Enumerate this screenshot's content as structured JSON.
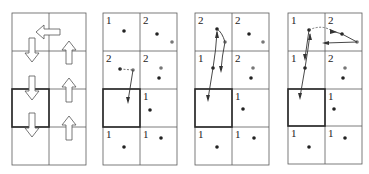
{
  "figure": {
    "panels": [
      {
        "id": "panel-1",
        "kind": "direction-field",
        "cells": [
          {
            "row": 0,
            "col": 0,
            "arrow": "none"
          },
          {
            "row": 0,
            "col": 1,
            "arrow": "left"
          },
          {
            "row": 1,
            "col": 0,
            "arrow": "down"
          },
          {
            "row": 1,
            "col": 1,
            "arrow": "up"
          },
          {
            "row": 2,
            "col": 0,
            "arrow": "down",
            "highlighted": true
          },
          {
            "row": 2,
            "col": 1,
            "arrow": "up"
          },
          {
            "row": 3,
            "col": 0,
            "arrow": "down"
          },
          {
            "row": 3,
            "col": 1,
            "arrow": "up"
          }
        ]
      },
      {
        "id": "panel-2",
        "kind": "occupancy",
        "labels": [
          {
            "row": 0,
            "col": 0,
            "text": "1"
          },
          {
            "row": 0,
            "col": 1,
            "text": "2"
          },
          {
            "row": 1,
            "col": 0,
            "text": "2"
          },
          {
            "row": 1,
            "col": 1,
            "text": "2"
          },
          {
            "row": 2,
            "col": 1,
            "text": "1"
          },
          {
            "row": 3,
            "col": 0,
            "text": "1"
          },
          {
            "row": 3,
            "col": 1,
            "text": "1"
          }
        ],
        "highlighted_cell": {
          "row": 2,
          "col": 0
        }
      },
      {
        "id": "panel-3",
        "kind": "occupancy",
        "labels": [
          {
            "row": 0,
            "col": 0,
            "text": "2"
          },
          {
            "row": 0,
            "col": 1,
            "text": "2"
          },
          {
            "row": 1,
            "col": 0,
            "text": "1"
          },
          {
            "row": 1,
            "col": 1,
            "text": "2"
          },
          {
            "row": 2,
            "col": 1,
            "text": "1"
          },
          {
            "row": 3,
            "col": 0,
            "text": "1"
          },
          {
            "row": 3,
            "col": 1,
            "text": "1"
          }
        ],
        "highlighted_cell": {
          "row": 2,
          "col": 0
        }
      },
      {
        "id": "panel-4",
        "kind": "occupancy",
        "labels": [
          {
            "row": 0,
            "col": 0,
            "text": "1"
          },
          {
            "row": 0,
            "col": 1,
            "text": "2"
          },
          {
            "row": 1,
            "col": 0,
            "text": "1"
          },
          {
            "row": 1,
            "col": 1,
            "text": "2"
          },
          {
            "row": 2,
            "col": 1,
            "text": "1"
          },
          {
            "row": 3,
            "col": 0,
            "text": "1"
          },
          {
            "row": 3,
            "col": 1,
            "text": "1"
          }
        ],
        "highlighted_cell": {
          "row": 2,
          "col": 0
        }
      }
    ],
    "colors": {
      "grid": "#5a5a5a",
      "highlight_border": "#2a2a2a",
      "dot_dark": "#222222",
      "dot_gray": "#777777"
    }
  }
}
